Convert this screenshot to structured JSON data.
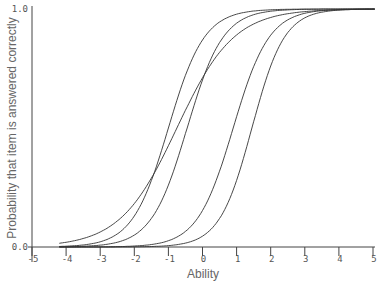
{
  "chart_data": {
    "type": "line",
    "title": "",
    "xlabel": "Ability",
    "ylabel": "Probability that item is answered correctly",
    "xlim": [
      -5,
      5
    ],
    "ylim": [
      0,
      1
    ],
    "x_ticks": [
      "-5",
      "-4",
      "-3",
      "-2",
      "-1",
      "0",
      "1",
      "2",
      "3",
      "4",
      "5"
    ],
    "y_ticks": [
      "0.0",
      "1.0"
    ],
    "grid": false,
    "legend": null,
    "series": [
      {
        "name": "Item 1",
        "model": "logistic",
        "a": 1.9,
        "b": -1.0
      },
      {
        "name": "Item 2",
        "model": "logistic",
        "a": 1.2,
        "b": -0.75
      },
      {
        "name": "Item 3",
        "model": "logistic",
        "a": 1.9,
        "b": -0.45
      },
      {
        "name": "Item 4",
        "model": "logistic",
        "a": 1.9,
        "b": 0.9
      },
      {
        "name": "Item 5",
        "model": "logistic",
        "a": 2.1,
        "b": 1.45
      }
    ]
  },
  "layout": {
    "x_px": [
      32,
      373
    ],
    "y_px": [
      247,
      9
    ]
  }
}
